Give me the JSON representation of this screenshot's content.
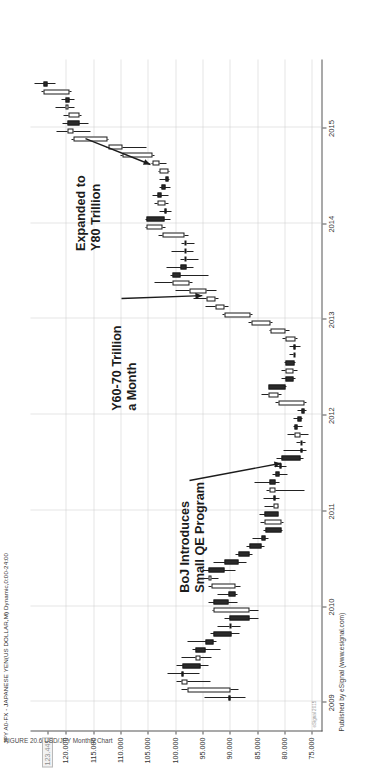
{
  "chart_data": {
    "type": "candlestick",
    "title": "JPY A0-FX - JAPANESE YEN(US DOLLAR,M) Dynamic,0:00-24:00",
    "xlabel": "",
    "ylabel": "",
    "grid": true,
    "legend_position": "none",
    "orientation_note": "chart rendered rotated 90 degrees counter-clockwise",
    "ylim": [
      73.0,
      126.5
    ],
    "ytick_labels": [
      "123.441",
      "120.000",
      "115.000",
      "110.000",
      "105.000",
      "100.000",
      "95.000",
      "90.000",
      "85.000",
      "80.000",
      "75.000"
    ],
    "ytick_values": [
      123.441,
      120.0,
      115.0,
      110.0,
      105.0,
      100.0,
      95.0,
      90.0,
      85.0,
      80.0,
      75.0
    ],
    "current_price_label": "123.441",
    "xtick_labels": [
      "2009",
      "2010",
      "2011",
      "2012",
      "2013",
      "2014",
      "2015"
    ],
    "xtick_values": [
      2009,
      2010,
      2011,
      2012,
      2013,
      2014,
      2015
    ],
    "watermark": "eSignal 2015",
    "credit": "Published by eSignal (www.esignal.com)",
    "caption": "FIGURE 20.6   USD/JPY Monthly Chart",
    "annotations": [
      {
        "id": "a1",
        "text_lines": [
          "Expanded to",
          "Y80 Trillion"
        ],
        "points_to_x": 2014.62,
        "points_to_y": 104.5
      },
      {
        "id": "a2",
        "text_lines": [
          "Y60-70 Trillion",
          "a Month"
        ],
        "points_to_x": 2013.25,
        "points_to_y": 95.0
      },
      {
        "id": "a3",
        "text_lines": [
          "BoJ Introduces",
          "Small QE Program"
        ],
        "points_to_x": 2011.5,
        "points_to_y": 80.5
      }
    ],
    "candles": [
      {
        "t": "2009-01",
        "o": 90.3,
        "h": 94.6,
        "l": 87.1,
        "c": 89.8
      },
      {
        "t": "2009-02",
        "o": 89.8,
        "h": 98.8,
        "l": 88.3,
        "c": 97.7
      },
      {
        "t": "2009-03",
        "o": 97.7,
        "h": 99.7,
        "l": 93.5,
        "c": 98.9
      },
      {
        "t": "2009-04",
        "o": 98.9,
        "h": 101.4,
        "l": 95.6,
        "c": 98.6
      },
      {
        "t": "2009-05",
        "o": 98.6,
        "h": 99.7,
        "l": 93.8,
        "c": 95.3
      },
      {
        "t": "2009-06",
        "o": 95.3,
        "h": 98.9,
        "l": 93.4,
        "c": 96.3
      },
      {
        "t": "2009-07",
        "o": 96.3,
        "h": 96.9,
        "l": 91.7,
        "c": 94.5
      },
      {
        "t": "2009-08",
        "o": 94.5,
        "h": 97.7,
        "l": 92.5,
        "c": 93.0
      },
      {
        "t": "2009-09",
        "o": 93.0,
        "h": 93.6,
        "l": 88.2,
        "c": 89.6
      },
      {
        "t": "2009-10",
        "o": 89.6,
        "h": 92.3,
        "l": 88.0,
        "c": 90.1
      },
      {
        "t": "2009-11",
        "o": 90.1,
        "h": 91.0,
        "l": 84.8,
        "c": 86.4
      },
      {
        "t": "2009-12",
        "o": 86.4,
        "h": 93.2,
        "l": 84.8,
        "c": 92.9
      },
      {
        "t": "2010-01",
        "o": 92.9,
        "h": 93.8,
        "l": 88.5,
        "c": 90.3
      },
      {
        "t": "2010-02",
        "o": 90.3,
        "h": 92.2,
        "l": 88.5,
        "c": 88.9
      },
      {
        "t": "2010-03",
        "o": 88.9,
        "h": 93.8,
        "l": 88.1,
        "c": 93.4
      },
      {
        "t": "2010-04",
        "o": 93.4,
        "h": 94.8,
        "l": 92.1,
        "c": 93.9
      },
      {
        "t": "2010-05",
        "o": 93.9,
        "h": 94.9,
        "l": 88.9,
        "c": 90.9
      },
      {
        "t": "2010-06",
        "o": 90.9,
        "h": 92.9,
        "l": 86.9,
        "c": 88.4
      },
      {
        "t": "2010-07",
        "o": 88.4,
        "h": 89.0,
        "l": 85.9,
        "c": 86.4
      },
      {
        "t": "2010-08",
        "o": 86.4,
        "h": 86.9,
        "l": 83.6,
        "c": 84.1
      },
      {
        "t": "2010-09",
        "o": 84.1,
        "h": 85.9,
        "l": 82.9,
        "c": 83.5
      },
      {
        "t": "2010-10",
        "o": 83.5,
        "h": 83.9,
        "l": 80.4,
        "c": 80.6
      },
      {
        "t": "2010-11",
        "o": 80.6,
        "h": 84.4,
        "l": 80.2,
        "c": 83.6
      },
      {
        "t": "2010-12",
        "o": 83.6,
        "h": 84.5,
        "l": 81.3,
        "c": 81.1
      },
      {
        "t": "2011-01",
        "o": 81.1,
        "h": 83.6,
        "l": 81.0,
        "c": 82.0
      },
      {
        "t": "2011-02",
        "o": 82.0,
        "h": 83.9,
        "l": 80.9,
        "c": 81.7
      },
      {
        "t": "2011-03",
        "o": 81.7,
        "h": 83.3,
        "l": 76.3,
        "c": 82.8
      },
      {
        "t": "2011-04",
        "o": 82.8,
        "h": 85.5,
        "l": 80.9,
        "c": 81.6
      },
      {
        "t": "2011-05",
        "o": 81.6,
        "h": 82.2,
        "l": 79.5,
        "c": 80.9
      },
      {
        "t": "2011-06",
        "o": 80.9,
        "h": 81.8,
        "l": 79.6,
        "c": 80.5
      },
      {
        "t": "2011-07",
        "o": 80.5,
        "h": 81.5,
        "l": 76.4,
        "c": 77.0
      },
      {
        "t": "2011-08",
        "o": 77.0,
        "h": 80.2,
        "l": 75.9,
        "c": 76.6
      },
      {
        "t": "2011-09",
        "o": 76.6,
        "h": 77.8,
        "l": 76.1,
        "c": 77.0
      },
      {
        "t": "2011-10",
        "o": 77.0,
        "h": 79.5,
        "l": 75.6,
        "c": 78.1
      },
      {
        "t": "2011-11",
        "o": 78.1,
        "h": 78.3,
        "l": 76.6,
        "c": 77.6
      },
      {
        "t": "2011-12",
        "o": 77.6,
        "h": 78.3,
        "l": 76.6,
        "c": 76.9
      },
      {
        "t": "2012-01",
        "o": 76.9,
        "h": 77.6,
        "l": 76.0,
        "c": 76.3
      },
      {
        "t": "2012-02",
        "o": 76.3,
        "h": 81.7,
        "l": 76.0,
        "c": 81.1
      },
      {
        "t": "2012-03",
        "o": 81.1,
        "h": 84.2,
        "l": 80.6,
        "c": 82.9
      },
      {
        "t": "2012-04",
        "o": 82.9,
        "h": 82.0,
        "l": 79.6,
        "c": 79.8
      },
      {
        "t": "2012-05",
        "o": 79.8,
        "h": 80.6,
        "l": 78.0,
        "c": 78.4
      },
      {
        "t": "2012-06",
        "o": 78.4,
        "h": 80.6,
        "l": 77.6,
        "c": 79.8
      },
      {
        "t": "2012-07",
        "o": 79.8,
        "h": 80.0,
        "l": 77.9,
        "c": 78.1
      },
      {
        "t": "2012-08",
        "o": 78.1,
        "h": 79.0,
        "l": 77.9,
        "c": 78.4
      },
      {
        "t": "2012-09",
        "o": 78.4,
        "h": 79.0,
        "l": 77.1,
        "c": 77.9
      },
      {
        "t": "2012-10",
        "o": 77.9,
        "h": 80.4,
        "l": 77.6,
        "c": 79.8
      },
      {
        "t": "2012-11",
        "o": 79.8,
        "h": 82.8,
        "l": 79.1,
        "c": 82.5
      },
      {
        "t": "2012-12",
        "o": 82.5,
        "h": 86.6,
        "l": 82.2,
        "c": 86.1
      },
      {
        "t": "2013-01",
        "o": 86.1,
        "h": 91.4,
        "l": 85.9,
        "c": 91.0
      },
      {
        "t": "2013-02",
        "o": 91.0,
        "h": 94.5,
        "l": 90.3,
        "c": 92.6
      },
      {
        "t": "2013-03",
        "o": 92.6,
        "h": 96.7,
        "l": 92.0,
        "c": 94.2
      },
      {
        "t": "2013-04",
        "o": 94.2,
        "h": 99.9,
        "l": 92.5,
        "c": 97.4
      },
      {
        "t": "2013-05",
        "o": 97.4,
        "h": 103.7,
        "l": 96.9,
        "c": 100.4
      },
      {
        "t": "2013-06",
        "o": 100.4,
        "h": 100.9,
        "l": 93.8,
        "c": 99.1
      },
      {
        "t": "2013-07",
        "o": 99.1,
        "h": 101.5,
        "l": 96.6,
        "c": 97.9
      },
      {
        "t": "2013-08",
        "o": 97.9,
        "h": 99.0,
        "l": 95.8,
        "c": 98.2
      },
      {
        "t": "2013-09",
        "o": 98.2,
        "h": 100.6,
        "l": 96.6,
        "c": 98.2
      },
      {
        "t": "2013-10",
        "o": 98.2,
        "h": 98.9,
        "l": 96.5,
        "c": 98.3
      },
      {
        "t": "2013-11",
        "o": 98.3,
        "h": 103.0,
        "l": 97.6,
        "c": 102.4
      },
      {
        "t": "2013-12",
        "o": 102.4,
        "h": 105.4,
        "l": 101.8,
        "c": 105.2
      },
      {
        "t": "2014-01",
        "o": 105.2,
        "h": 105.5,
        "l": 100.8,
        "c": 102.0
      },
      {
        "t": "2014-02",
        "o": 102.0,
        "h": 102.8,
        "l": 100.7,
        "c": 101.8
      },
      {
        "t": "2014-03",
        "o": 101.8,
        "h": 103.8,
        "l": 101.2,
        "c": 103.2
      },
      {
        "t": "2014-04",
        "o": 103.2,
        "h": 104.1,
        "l": 101.3,
        "c": 102.5
      },
      {
        "t": "2014-05",
        "o": 102.5,
        "h": 102.8,
        "l": 100.8,
        "c": 101.7
      },
      {
        "t": "2014-06",
        "o": 101.7,
        "h": 102.8,
        "l": 101.0,
        "c": 101.3
      },
      {
        "t": "2014-07",
        "o": 101.3,
        "h": 103.0,
        "l": 101.1,
        "c": 102.8
      },
      {
        "t": "2014-08",
        "o": 102.8,
        "h": 104.3,
        "l": 101.5,
        "c": 104.1
      },
      {
        "t": "2014-09",
        "o": 104.1,
        "h": 110.1,
        "l": 103.8,
        "c": 109.6
      },
      {
        "t": "2014-10",
        "o": 109.6,
        "h": 112.5,
        "l": 105.2,
        "c": 112.3
      },
      {
        "t": "2014-11",
        "o": 112.3,
        "h": 118.9,
        "l": 112.2,
        "c": 118.6
      },
      {
        "t": "2014-12",
        "o": 118.6,
        "h": 121.8,
        "l": 115.5,
        "c": 119.8
      },
      {
        "t": "2015-01",
        "o": 119.8,
        "h": 120.7,
        "l": 115.8,
        "c": 117.5
      },
      {
        "t": "2015-02",
        "o": 117.5,
        "h": 120.5,
        "l": 117.2,
        "c": 119.5
      },
      {
        "t": "2015-03",
        "o": 119.5,
        "h": 122.0,
        "l": 118.5,
        "c": 120.1
      },
      {
        "t": "2015-04",
        "o": 120.1,
        "h": 120.8,
        "l": 118.5,
        "c": 119.4
      },
      {
        "t": "2015-05",
        "o": 119.4,
        "h": 124.4,
        "l": 118.9,
        "c": 124.1
      },
      {
        "t": "2015-06",
        "o": 124.1,
        "h": 125.8,
        "l": 122.0,
        "c": 123.4
      }
    ]
  }
}
